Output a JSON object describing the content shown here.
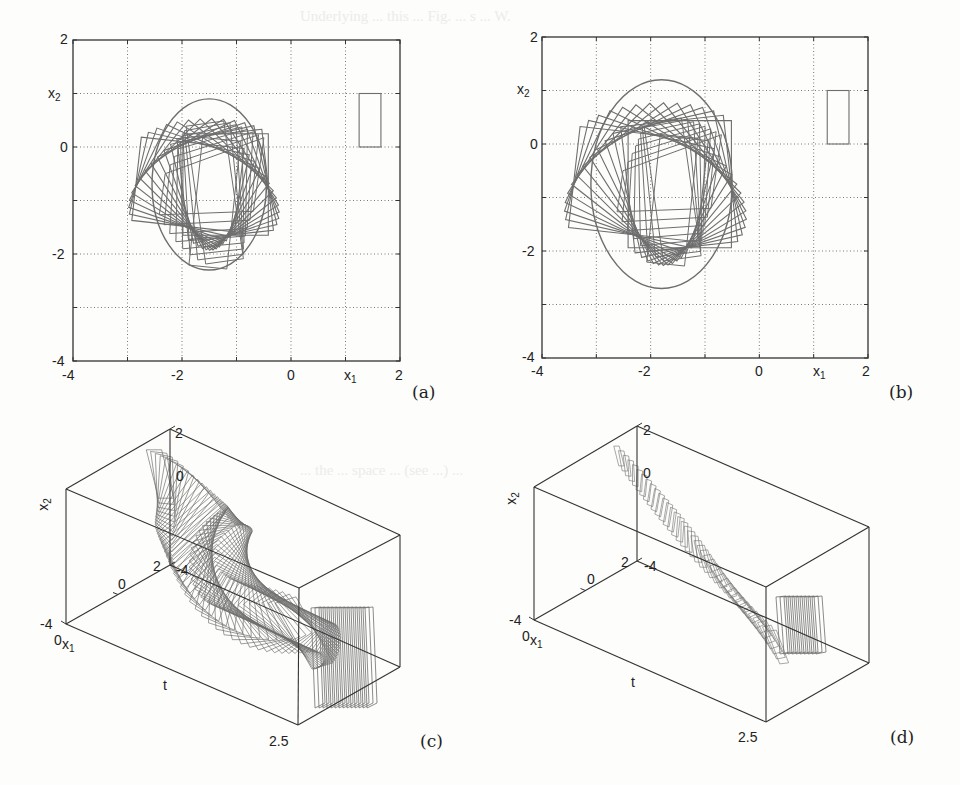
{
  "figure": {
    "panels": [
      {
        "id": "a",
        "caption": "(a)",
        "type": "2d",
        "xlabel": "x1",
        "ylabel": "x2",
        "xticks": [
          "-4",
          "-2",
          "0",
          "2"
        ],
        "yticks": [
          "2",
          "0",
          "-2",
          "-4"
        ]
      },
      {
        "id": "b",
        "caption": "(b)",
        "type": "2d",
        "xlabel": "x1",
        "ylabel": "x2",
        "xticks": [
          "-4",
          "-2",
          "0",
          "2"
        ],
        "yticks": [
          "2",
          "0",
          "-2",
          "-4"
        ]
      },
      {
        "id": "c",
        "caption": "(c)",
        "type": "3d",
        "xlabel": "x1",
        "ylabel": "x2",
        "tlabel": "t",
        "ticks": {
          "x1_low": "-4",
          "x1_mid": "0",
          "x1_high": "2",
          "x2_low": "-4",
          "x2_top": "2",
          "x2_zero": "0",
          "t_start": "0",
          "t_end": "2.5"
        }
      },
      {
        "id": "d",
        "caption": "(d)",
        "type": "3d",
        "xlabel": "x1",
        "ylabel": "x2",
        "tlabel": "t",
        "ticks": {
          "x1_low": "-4",
          "x1_mid": "0",
          "x1_high": "2",
          "x2_low": "-4",
          "x2_top": "2",
          "x2_zero": "0",
          "t_start": "0",
          "t_end": "2.5"
        }
      }
    ]
  },
  "chart_data": [
    {
      "type": "scatter",
      "title": "(a) Trajectory of rotating rectangle in x1-x2 plane",
      "xlabel": "x1",
      "ylabel": "x2",
      "xlim": [
        -4,
        2
      ],
      "ylim": [
        -4,
        2
      ],
      "xticks": [
        -4,
        -2,
        0,
        2
      ],
      "yticks": [
        -4,
        -2,
        0,
        2
      ],
      "grid": true,
      "grid_style": "dotted",
      "grid_step": 1,
      "reference_rectangle": {
        "x1": [
          1.25,
          1.65
        ],
        "x2": [
          0,
          1
        ]
      },
      "outer_squares": {
        "center": [
          -1.55,
          -0.7
        ],
        "side": 1.65,
        "count": 14,
        "rotation_deg_range": [
          0,
          90
        ]
      },
      "envelope_ellipse": {
        "center": [
          -1.5,
          -0.7
        ],
        "rx": 1.05,
        "ry": 1.6
      },
      "inner_shapes": {
        "center": [
          -1.5,
          -0.85
        ],
        "count": 8
      }
    },
    {
      "type": "scatter",
      "title": "(b) Trajectory of rotating rectangle in x1-x2 plane",
      "xlabel": "x1",
      "ylabel": "x2",
      "xlim": [
        -4,
        2
      ],
      "ylim": [
        -4,
        2
      ],
      "xticks": [
        -4,
        -2,
        0,
        2
      ],
      "yticks": [
        -4,
        -2,
        0,
        2
      ],
      "grid": true,
      "grid_style": "dotted",
      "grid_step": 1,
      "reference_rectangle": {
        "x1": [
          1.25,
          1.65
        ],
        "x2": [
          0,
          1
        ]
      },
      "outer_squares": {
        "center": [
          -1.85,
          -0.75
        ],
        "side": 1.9,
        "count": 14,
        "rotation_deg_range": [
          0,
          90
        ]
      },
      "envelope_ellipse": {
        "center": [
          -1.8,
          -0.75
        ],
        "rx": 1.3,
        "ry": 1.95
      },
      "inner_shapes": {
        "center": [
          -1.7,
          -0.85
        ],
        "count": 8
      }
    },
    {
      "type": "line",
      "title": "(c) 3D time evolution",
      "xlabel": "x1",
      "ylabel": "x2",
      "zlabel": "t",
      "x1_ticks": [
        -4,
        0,
        2
      ],
      "x2_ticks": [
        -4,
        0,
        2
      ],
      "t_range": [
        0,
        2.5
      ],
      "frames": 60,
      "trail": "dense"
    },
    {
      "type": "line",
      "title": "(d) 3D time evolution",
      "xlabel": "x1",
      "ylabel": "x2",
      "zlabel": "t",
      "x1_ticks": [
        -4,
        0,
        2
      ],
      "x2_ticks": [
        -4,
        0,
        2
      ],
      "t_range": [
        0,
        2.5
      ],
      "frames": 40,
      "trail": "sparse"
    }
  ],
  "style": {
    "axis_color": "#333333",
    "line_color": "#6e6e6e",
    "grid_color": "#555555",
    "background": "#fdfdfb"
  }
}
